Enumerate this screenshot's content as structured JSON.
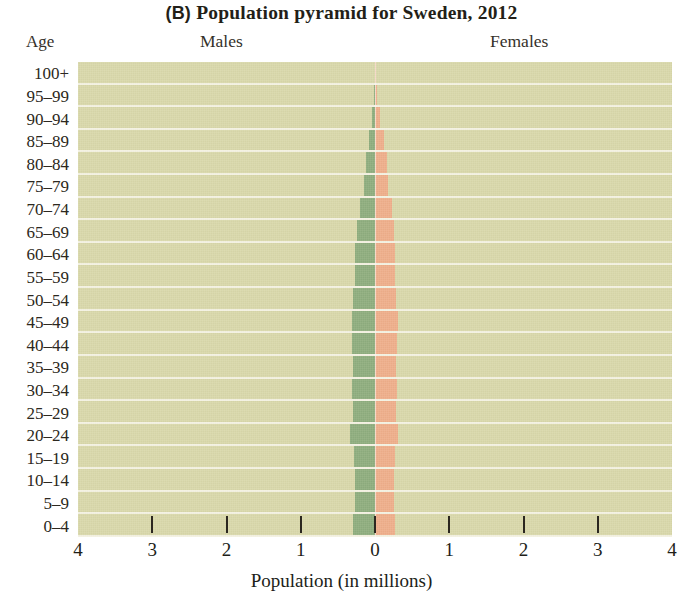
{
  "title": {
    "panel_letter": "(B)",
    "text": "Population pyramid for Sweden, 2012",
    "full": "(B) Population pyramid for Sweden, 2012"
  },
  "headers": {
    "age": "Age",
    "males": "Males",
    "females": "Females"
  },
  "axis": {
    "x_title": "Population (in millions)",
    "x_tick_labels": [
      "4",
      "3",
      "2",
      "1",
      "0",
      "1",
      "2",
      "3",
      "4"
    ],
    "x_tick_values": [
      -4,
      -3,
      -2,
      -1,
      0,
      1,
      2,
      3,
      4
    ],
    "y_title": "Age"
  },
  "colors": {
    "male_bar": "#8fae7e",
    "female_bar": "#efaf8b",
    "plot_background": "#d9d8ab",
    "gridline": "#f4f2e2",
    "text": "#231f18"
  },
  "chart_data": {
    "type": "bar",
    "subtype": "population-pyramid",
    "title": "(B) Population pyramid for Sweden, 2012",
    "xlabel": "Population (in millions)",
    "ylabel": "Age",
    "xlim": [
      -4,
      4
    ],
    "xticks": [
      -4,
      -3,
      -2,
      -1,
      0,
      1,
      2,
      3,
      4
    ],
    "xticklabels": [
      "4",
      "3",
      "2",
      "1",
      "0",
      "1",
      "2",
      "3",
      "4"
    ],
    "grid": true,
    "legend": [
      "Males",
      "Females"
    ],
    "legend_position": "above-axes",
    "categories": [
      "100+",
      "95–99",
      "90–94",
      "85–89",
      "80–84",
      "75–79",
      "70–74",
      "65–69",
      "60–64",
      "55–59",
      "50–54",
      "45–49",
      "40–44",
      "35–39",
      "30–34",
      "25–29",
      "20–24",
      "15–19",
      "10–14",
      "5–9",
      "0–4"
    ],
    "series": [
      {
        "name": "Males",
        "side": "left",
        "color": "#8fae7e",
        "values": [
          0.002,
          0.012,
          0.035,
          0.075,
          0.115,
          0.145,
          0.205,
          0.245,
          0.27,
          0.275,
          0.29,
          0.315,
          0.305,
          0.29,
          0.305,
          0.3,
          0.33,
          0.28,
          0.27,
          0.275,
          0.29
        ]
      },
      {
        "name": "Females",
        "side": "right",
        "color": "#efaf8b",
        "values": [
          0.006,
          0.03,
          0.07,
          0.12,
          0.16,
          0.175,
          0.225,
          0.25,
          0.275,
          0.275,
          0.285,
          0.305,
          0.295,
          0.28,
          0.29,
          0.285,
          0.315,
          0.265,
          0.255,
          0.26,
          0.275
        ]
      }
    ]
  }
}
